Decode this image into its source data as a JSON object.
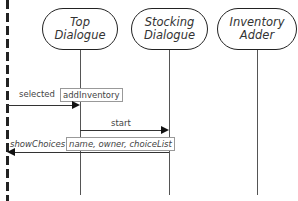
{
  "diagram": {
    "type": "sequence-diagram",
    "actor_boundary": "dashed",
    "participants": [
      {
        "id": "top",
        "line1": "Top",
        "line2": "Dialogue"
      },
      {
        "id": "stocking",
        "line1": "Stocking",
        "line2": "Dialogue"
      },
      {
        "id": "adder",
        "line1": "Inventory",
        "line2": "Adder"
      }
    ],
    "messages": [
      {
        "label": "selected",
        "param": "addInventory",
        "from": "actor",
        "to": "top"
      },
      {
        "label": "start",
        "param": "",
        "from": "top",
        "to": "stocking"
      },
      {
        "label": "showChoices",
        "param": "name, owner, choiceList",
        "from": "stocking",
        "to": "actor"
      }
    ]
  }
}
